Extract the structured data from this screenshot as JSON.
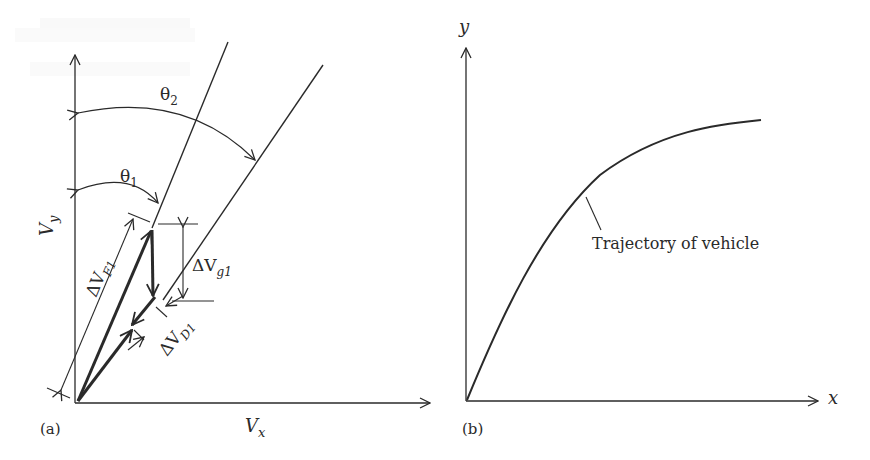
{
  "figure": {
    "panels": [
      {
        "id": "a",
        "caption": "(a)",
        "axes": {
          "x_label": "V",
          "x_sub": "x",
          "y_label": "V",
          "y_sub": "y"
        },
        "angles": [
          {
            "label": "θ",
            "sub": "1"
          },
          {
            "label": "θ",
            "sub": "2"
          }
        ],
        "vectors": [
          {
            "label": "ΔV",
            "sub": "F1"
          },
          {
            "label": "ΔV",
            "sub": "g1"
          },
          {
            "label": "ΔV",
            "sub": "D1"
          }
        ]
      },
      {
        "id": "b",
        "caption": "(b)",
        "axes": {
          "x_label": "x",
          "y_label": "y"
        },
        "curve_label": "Trajectory of vehicle"
      }
    ],
    "colors": {
      "ink": "#2a2a2a",
      "background": "#ffffff"
    }
  }
}
